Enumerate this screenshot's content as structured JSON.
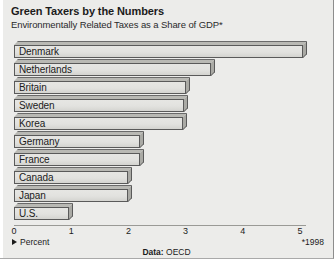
{
  "chart_data": {
    "type": "bar",
    "orientation": "horizontal",
    "title": "Green Taxers by the Numbers",
    "subtitle": "Environmentally Related Taxes as a Share of GDP*",
    "xlabel": "Percent",
    "ylabel": "",
    "xlim": [
      0,
      5.2
    ],
    "grid": false,
    "legend": "Percent",
    "footnote": "*1998",
    "source_prefix": "Data:",
    "source_value": "OECD",
    "tick_labels": [
      "0",
      "1",
      "2",
      "3",
      "4",
      "5"
    ],
    "tick_values": [
      0,
      1,
      2,
      3,
      4,
      5
    ],
    "categories": [
      "Denmark",
      "Netherlands",
      "Britain",
      "Sweden",
      "Korea",
      "Germany",
      "France",
      "Canada",
      "Japan",
      "U.S."
    ],
    "values": [
      5.05,
      3.45,
      3.0,
      2.98,
      2.95,
      2.2,
      2.2,
      2.0,
      2.0,
      0.97
    ],
    "series": [
      {
        "name": "Environmentally Related Taxes as a Share of GDP",
        "values": [
          5.05,
          3.45,
          3.0,
          2.98,
          2.95,
          2.2,
          2.2,
          2.0,
          2.0,
          0.97
        ]
      }
    ]
  },
  "colors": {
    "background": "#ececea",
    "bar_face": "#e2e2df",
    "bar_edge": "#5a5a5a",
    "text": "#1b1b1b"
  }
}
